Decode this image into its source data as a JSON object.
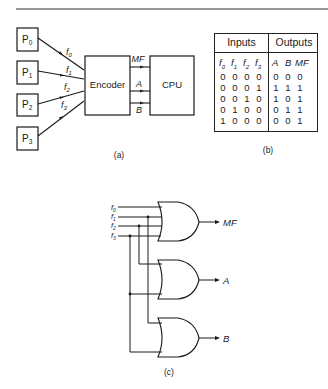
{
  "figure_a": {
    "processors": [
      "P0",
      "P1",
      "P2",
      "P3"
    ],
    "processor_base": "P",
    "processor_subs": [
      "0",
      "1",
      "2",
      "3"
    ],
    "signals": [
      "f0",
      "f1",
      "f2",
      "f3"
    ],
    "encoder_label": "Encoder",
    "cpu_label": "CPU",
    "outputs": [
      "MF",
      "A",
      "B"
    ],
    "caption": "(a)"
  },
  "figure_b": {
    "header_inputs": "Inputs",
    "header_outputs": "Outputs",
    "input_cols": [
      "f0",
      "f1",
      "f2",
      "f3"
    ],
    "output_cols": [
      "A",
      "B",
      "MF"
    ],
    "rows": [
      {
        "inputs": [
          "0",
          "0",
          "0",
          "0"
        ],
        "outputs": [
          "0",
          "0",
          "0"
        ]
      },
      {
        "inputs": [
          "0",
          "0",
          "0",
          "1"
        ],
        "outputs": [
          "1",
          "1",
          "1"
        ]
      },
      {
        "inputs": [
          "0",
          "0",
          "1",
          "0"
        ],
        "outputs": [
          "1",
          "0",
          "1"
        ]
      },
      {
        "inputs": [
          "0",
          "1",
          "0",
          "0"
        ],
        "outputs": [
          "0",
          "1",
          "1"
        ]
      },
      {
        "inputs": [
          "1",
          "0",
          "0",
          "0"
        ],
        "outputs": [
          "0",
          "0",
          "1"
        ]
      }
    ],
    "caption": "(b)"
  },
  "figure_c": {
    "inputs": [
      "f0",
      "f1",
      "f2",
      "f3"
    ],
    "gate_type": "OR",
    "gate_outputs": [
      "MF",
      "A",
      "B"
    ],
    "caption": "(c)"
  }
}
